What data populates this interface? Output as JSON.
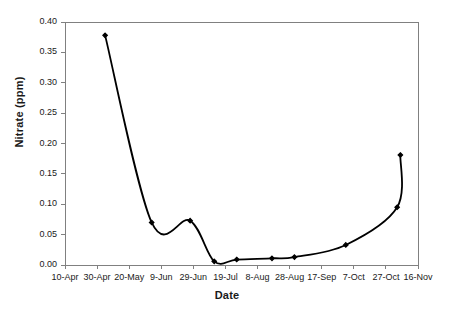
{
  "chart_data": {
    "type": "line",
    "title": "",
    "xlabel": "Date",
    "ylabel": "Nitrate (ppm)",
    "ylim": [
      0.0,
      0.4
    ],
    "ytick_labels": [
      "0.00",
      "0.05",
      "0.10",
      "0.15",
      "0.20",
      "0.25",
      "0.30",
      "0.35",
      "0.40"
    ],
    "ytick_values": [
      0.0,
      0.05,
      0.1,
      0.15,
      0.2,
      0.25,
      0.3,
      0.35,
      0.4
    ],
    "xtick_labels": [
      "10-Apr",
      "30-Apr",
      "20-May",
      "9-Jun",
      "29-Jun",
      "19-Jul",
      "8-Aug",
      "28-Aug",
      "17-Sep",
      "7-Oct",
      "27-Oct",
      "16-Nov"
    ],
    "xlim_labels": [
      "10-Apr",
      "16-Nov"
    ],
    "grid": false,
    "legend": false,
    "series": [
      {
        "name": "Nitrate",
        "marker": "diamond",
        "color": "#000000",
        "line_color": "#000000",
        "points": [
          {
            "x_label": "5-May",
            "x_day": 25,
            "value": 0.378
          },
          {
            "x_label": "3-Jun",
            "x_day": 54,
            "value": 0.07
          },
          {
            "x_label": "27-Jun",
            "x_day": 78,
            "value": 0.073
          },
          {
            "x_label": "12-Jul",
            "x_day": 93,
            "value": 0.006
          },
          {
            "x_label": "26-Jul",
            "x_day": 107,
            "value": 0.009
          },
          {
            "x_label": "17-Aug",
            "x_day": 129,
            "value": 0.011
          },
          {
            "x_label": "31-Aug",
            "x_day": 143,
            "value": 0.013
          },
          {
            "x_label": "2-Oct",
            "x_day": 175,
            "value": 0.033
          },
          {
            "x_label": "434-Oct",
            "x_day": 207,
            "value": 0.095
          },
          {
            "x_label": "2-Nov",
            "x_day": 209,
            "value": 0.181
          }
        ]
      }
    ]
  },
  "axes": {
    "frame_color": "#808080",
    "tick_color": "#808080"
  }
}
